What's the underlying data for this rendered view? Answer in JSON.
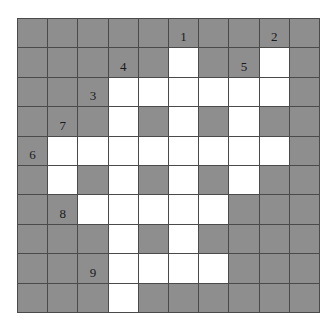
{
  "puzzle": {
    "type": "crossword-grid",
    "rows": 10,
    "cols": 10,
    "colors": {
      "block": "#8e8e8e",
      "open": "#ffffff",
      "gridline": "#4a4a4a",
      "number": "#1a1a1a"
    },
    "layout": [
      "BBBBBBBBBB",
      "BBBBBWBBWB",
      "BBBWWWWWWB",
      "BBBWBWBWBB",
      "BWWWWWWWWB",
      "BWBWBWBWBB",
      "BBWWWWWBBB",
      "BBBWBWBBBB",
      "BBBWWWWBBB",
      "BBBWBBBBBB"
    ],
    "clue_numbers": [
      {
        "label": "1",
        "row": 0,
        "col": 5
      },
      {
        "label": "2",
        "row": 0,
        "col": 8
      },
      {
        "label": "4",
        "row": 1,
        "col": 3
      },
      {
        "label": "5",
        "row": 1,
        "col": 7
      },
      {
        "label": "3",
        "row": 2,
        "col": 2
      },
      {
        "label": "7",
        "row": 3,
        "col": 1
      },
      {
        "label": "6",
        "row": 4,
        "col": 0
      },
      {
        "label": "8",
        "row": 6,
        "col": 1
      },
      {
        "label": "9",
        "row": 8,
        "col": 2
      }
    ]
  }
}
